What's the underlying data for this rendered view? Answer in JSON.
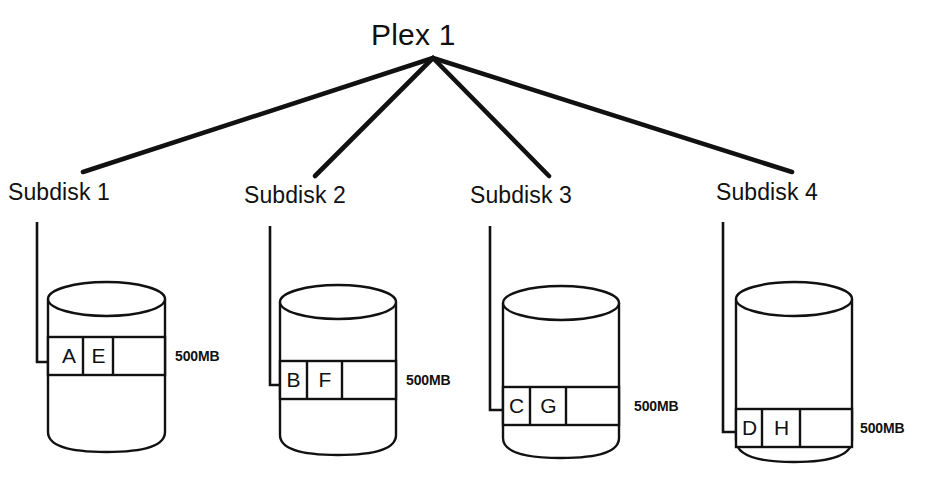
{
  "diagram": {
    "title": "Plex 1",
    "stroke_color": "#111111",
    "background_color": "#ffffff",
    "type": "storage-plex-subdisk-diagram"
  },
  "subdisks": [
    {
      "label": "Subdisk 1",
      "capacity": "500MB",
      "cells": [
        "A",
        "E",
        ""
      ]
    },
    {
      "label": "Subdisk 2",
      "capacity": "500MB",
      "cells": [
        "B",
        "F",
        ""
      ]
    },
    {
      "label": "Subdisk 3",
      "capacity": "500MB",
      "cells": [
        "C",
        "G",
        ""
      ]
    },
    {
      "label": "Subdisk 4",
      "capacity": "500MB",
      "cells": [
        "D",
        "H",
        ""
      ]
    }
  ]
}
